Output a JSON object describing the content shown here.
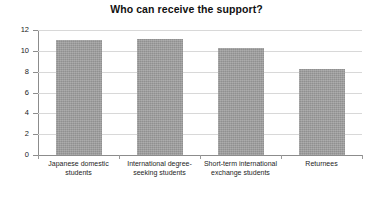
{
  "chart_data": {
    "type": "bar",
    "title": "Who can receive the support?",
    "xlabel": "",
    "ylabel": "",
    "categories": [
      "Japanese domestic students",
      "International degree-seeking students",
      "Short-term international exchange students",
      "Returnees"
    ],
    "values": [
      11.05,
      11.15,
      10.25,
      8.3
    ],
    "ylim": [
      0,
      12
    ],
    "yticks": [
      0,
      2,
      4,
      6,
      8,
      10,
      12
    ],
    "ytick_labels": [
      "0",
      "2",
      "4",
      "6",
      "8",
      "10",
      "12"
    ],
    "grid": true,
    "legend": null,
    "bar_color": "#9c9c9c",
    "gridline_color": "#d8d8d8",
    "axis_color": "#8c8c8c"
  }
}
